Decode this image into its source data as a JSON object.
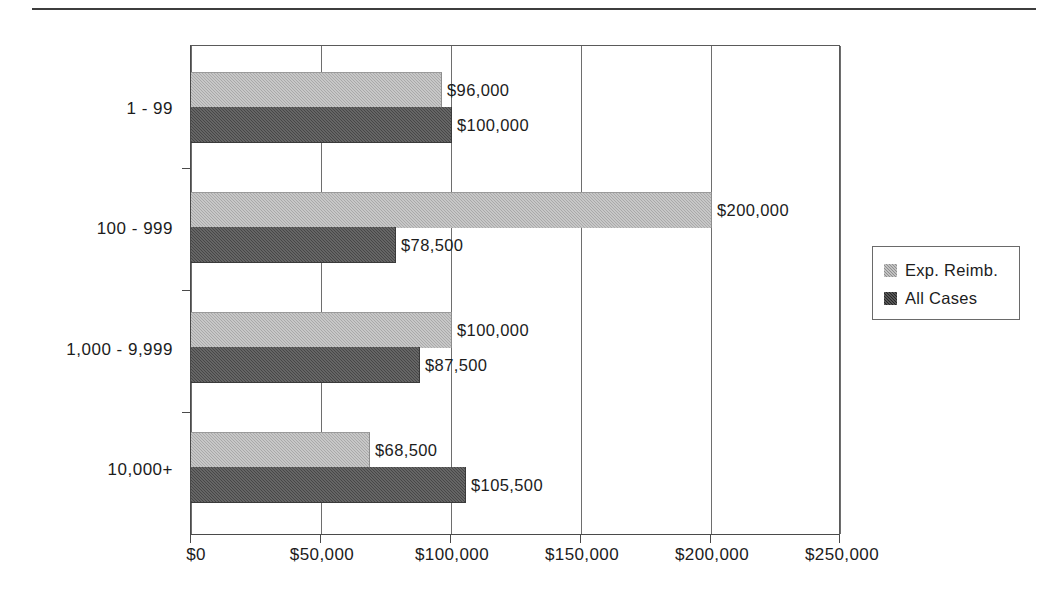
{
  "figure": {
    "top_rule": true
  },
  "chart_data": {
    "type": "bar",
    "orientation": "horizontal",
    "title": "",
    "subtitle": "",
    "xlabel": "",
    "ylabel": "",
    "categories": [
      "1 - 99",
      "100 - 999",
      "1,000 - 9,999",
      "10,000+"
    ],
    "series": [
      {
        "name": "Exp. Reimb.",
        "color": "#a9a9a9",
        "values": [
          96000,
          200000,
          100000,
          68500
        ],
        "data_labels": [
          "$96,000",
          "$200,000",
          "$100,000",
          "$68,500"
        ]
      },
      {
        "name": "All Cases",
        "color": "#474747",
        "values": [
          100000,
          78500,
          87500,
          105500
        ],
        "data_labels": [
          "$100,000",
          "$78,500",
          "$87,500",
          "$105,500"
        ]
      }
    ],
    "xlim": [
      0,
      250000
    ],
    "xticks": [
      0,
      50000,
      100000,
      150000,
      200000,
      250000
    ],
    "xticklabels": [
      "$0",
      "$50,000",
      "$100,000",
      "$150,000",
      "$200,000",
      "$250,000"
    ],
    "grid": "vertical",
    "legend_position": "right"
  },
  "legend": {
    "entries": [
      {
        "label": "Exp. Reimb.",
        "swatch": "light-gray-swatch"
      },
      {
        "label": "All Cases",
        "swatch": "dark-gray-swatch"
      }
    ]
  }
}
